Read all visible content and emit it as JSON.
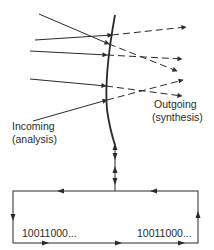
{
  "diagram": {
    "type": "wave-front analysis/synthesis loop",
    "labels": {
      "incoming_line1": "Incoming",
      "incoming_line2": "(analysis)",
      "outgoing_line1": "Outgoing",
      "outgoing_line2": "(synthesis)",
      "bits_left": "10011000...",
      "bits_right": "10011000..."
    },
    "colors": {
      "stroke": "#2a2a2a",
      "background": "#ffffff"
    },
    "surface_curve": "M115,15 Q104,75 107,110 Q110,130 115,145",
    "incoming_rays": [
      {
        "x1": 39,
        "y1": 14,
        "x2": 109,
        "y2": 44
      },
      {
        "x1": 35,
        "y1": 40,
        "x2": 112,
        "y2": 35
      },
      {
        "x1": 30,
        "y1": 51,
        "x2": 107,
        "y2": 55
      },
      {
        "x1": 30,
        "y1": 79,
        "x2": 106,
        "y2": 86
      },
      {
        "x1": 33,
        "y1": 121,
        "x2": 107,
        "y2": 100
      }
    ],
    "outgoing_rays": [
      {
        "x1": 112,
        "y1": 35,
        "x2": 186,
        "y2": 27
      },
      {
        "x1": 109,
        "y1": 44,
        "x2": 177,
        "y2": 71
      },
      {
        "x1": 107,
        "y1": 55,
        "x2": 182,
        "y2": 59
      },
      {
        "x1": 106,
        "y1": 86,
        "x2": 182,
        "y2": 96
      },
      {
        "x1": 107,
        "y1": 100,
        "x2": 183,
        "y2": 80
      }
    ],
    "connector": {
      "x": 115,
      "y1": 145,
      "y2": 191
    },
    "loop_rect": {
      "x": 13,
      "y": 191,
      "width": 185,
      "height": 52
    }
  }
}
